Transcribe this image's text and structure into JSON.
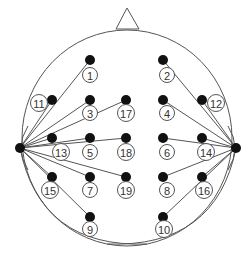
{
  "diagram": {
    "type": "eeg-electrode-montage",
    "colors": {
      "line": "#555555",
      "dot": "#111111",
      "label": "#333333",
      "background": "#ffffff"
    },
    "head": {
      "cx": 127,
      "cy": 138,
      "rx": 105,
      "ry": 108
    },
    "nose": {
      "apex": [
        127,
        8
      ],
      "left": [
        116,
        29
      ],
      "right": [
        139,
        29
      ]
    },
    "references": [
      {
        "id": "left-reference",
        "x": 20,
        "y": 148
      },
      {
        "id": "right-reference",
        "x": 236,
        "y": 148
      }
    ],
    "electrodes": [
      {
        "label": "1",
        "x": 90,
        "y": 60,
        "lx": 90,
        "ly": 75,
        "ref": 0
      },
      {
        "label": "2",
        "x": 163,
        "y": 60,
        "lx": 167,
        "ly": 75,
        "ref": 1
      },
      {
        "label": "11",
        "x": 52,
        "y": 100,
        "lx": 39,
        "ly": 103,
        "ref": 0
      },
      {
        "label": "3",
        "x": 90,
        "y": 100,
        "lx": 90,
        "ly": 113,
        "ref": 0
      },
      {
        "label": "17",
        "x": 126,
        "y": 100,
        "lx": 126,
        "ly": 113,
        "ref": 0
      },
      {
        "label": "4",
        "x": 163,
        "y": 100,
        "lx": 167,
        "ly": 113,
        "ref": 1
      },
      {
        "label": "12",
        "x": 202,
        "y": 100,
        "lx": 216,
        "ly": 103,
        "ref": 1
      },
      {
        "label": "13",
        "x": 52,
        "y": 138,
        "lx": 61,
        "ly": 152,
        "ref": 0
      },
      {
        "label": "5",
        "x": 90,
        "y": 138,
        "lx": 90,
        "ly": 152,
        "ref": 0
      },
      {
        "label": "18",
        "x": 126,
        "y": 138,
        "lx": 126,
        "ly": 152,
        "ref": 0
      },
      {
        "label": "6",
        "x": 163,
        "y": 138,
        "lx": 167,
        "ly": 152,
        "ref": 1
      },
      {
        "label": "14",
        "x": 202,
        "y": 138,
        "lx": 206,
        "ly": 152,
        "ref": 1
      },
      {
        "label": "15",
        "x": 52,
        "y": 177,
        "lx": 50,
        "ly": 190,
        "ref": 0
      },
      {
        "label": "7",
        "x": 90,
        "y": 177,
        "lx": 90,
        "ly": 190,
        "ref": 0
      },
      {
        "label": "19",
        "x": 126,
        "y": 177,
        "lx": 126,
        "ly": 190,
        "ref": 0
      },
      {
        "label": "8",
        "x": 163,
        "y": 177,
        "lx": 167,
        "ly": 190,
        "ref": 1
      },
      {
        "label": "16",
        "x": 202,
        "y": 177,
        "lx": 204,
        "ly": 190,
        "ref": 1
      },
      {
        "label": "9",
        "x": 90,
        "y": 217,
        "lx": 90,
        "ly": 229,
        "ref": 0
      },
      {
        "label": "10",
        "x": 163,
        "y": 217,
        "lx": 164,
        "ly": 229,
        "ref": 1
      }
    ]
  }
}
